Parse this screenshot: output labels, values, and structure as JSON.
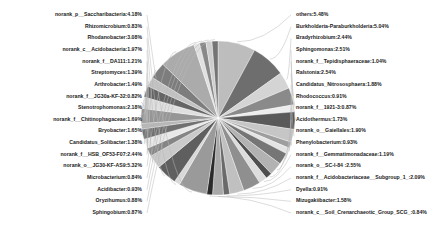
{
  "chart_data": {
    "type": "pie",
    "title": "",
    "subtitle": "",
    "xlabel": "",
    "ylabel": "",
    "legend_position": "labels-with-leader-lines",
    "grid": false,
    "value_unit": "percent",
    "palette": "grayscale",
    "center": {
      "x": 218,
      "y": 118
    },
    "radius": 77,
    "start_angle_deg": -90,
    "direction": "clockwise",
    "categories": [
      "others",
      "Burkholderia-Paraburkholderia",
      "Bradyrhizobium",
      "Sphingomonas",
      "norank_f__Tepidisphaeraceae",
      "Ralstonia",
      "Candidatus_Nitrososphaera",
      "Rhodococcus",
      "norank_f__1921-3",
      "Acidothermus",
      "norank_o__Gaiellales",
      "Phenylobacterium",
      "norank_f__Gemmatimonadaceae",
      "norank_o__SC-I-84",
      "norank_f__Acidobacteriaceae__Subgroup_1_",
      "Dyella",
      "Mizugakiibacter",
      "norank_c__Soil_Crenarchaeotic_Group_SCG_",
      "norank_p__Saccharibacteria",
      "Rhizomicrobium",
      "Rhodanobacter",
      "norank_c__Acidobacteria",
      "norank_f__DA111",
      "Streptomyces",
      "Arthrobacter",
      "norank_f__JG30a-KF-32",
      "Stenotrophomonas",
      "norank_f__Chitinophagaceae",
      "Bryobacter",
      "Candidatus_Solibacter",
      "norank_f__HSB_OF53-F07",
      "norank_o__JG30-KF-AS9",
      "Microbacterium",
      "Acidibacter",
      "Oryzihumus",
      "Sphingobium"
    ],
    "values": [
      5.48,
      5.04,
      2.44,
      2.51,
      1.04,
      2.54,
      1.88,
      0.91,
      0.87,
      1.73,
      1.9,
      0.93,
      1.19,
      2.55,
      2.09,
      0.91,
      1.58,
      0.84,
      4.18,
      0.83,
      3.08,
      1.97,
      1.21,
      1.39,
      1.49,
      0.82,
      2.18,
      1.69,
      1.65,
      1.38,
      2.44,
      5.32,
      0.84,
      0.93,
      0.88,
      0.87
    ],
    "labels": [
      "others:5.48%",
      "Burkholderia-Paraburkholderia:5.04%",
      "Bradyrhizobium:2.44%",
      "Sphingomonas:2.51%",
      "norank_f__Tepidisphaeraceae:1.04%",
      "Ralstonia:2.54%",
      "Candidatus_Nitrososphaera:1.88%",
      "Rhodococcus:0.91%",
      "norank_f__1921-3:0.87%",
      "Acidothermus:1.73%",
      "norank_o__Gaiellales:1.90%",
      "Phenylobacterium:0.93%",
      "norank_f__Gemmatimonadaceae:1.19%",
      "norank_o__SC-I-84 :2.55%",
      "norank_f__Acidobacteriaceae__Subgroup_1_:2.09%",
      "Dyella:0.91%",
      "Mizugakiibacter:1.58%",
      "norank_c__Soil_Crenarchaeotic_Group_SCG_:0.84%",
      "norank_p__Saccharibacteria:4.18%",
      "Rhizomicrobium:0.83%",
      "Rhodanobacter:3.08%",
      "norank_c__Acidobacteria:1.97%",
      "norank_f__DA111:1.21%",
      "Streptomyces:1.39%",
      "Arthrobacter:1.49%",
      "norank_f__JG30a-KF-32:0.82%",
      "Stenotrophomonas:2.18%",
      "norank_f__Chitinophagaceae:1.69%",
      "Bryobacter:1.65%",
      "Candidatus_Solibacter:1.38%",
      "norank_f__HSB_OF53-F07:2.44%",
      "norank_o__JG30-KF-AS9:5.32%",
      "Microbacterium:0.84%",
      "Acidibacter:0.93%",
      "Oryzihumus:0.88%",
      "Sphingobium:0.87%"
    ],
    "colors": [
      "#bdbdbd",
      "#6e6e6e",
      "#d4d4d4",
      "#8a8a8a",
      "#ededed",
      "#5a5a5a",
      "#c6c6c6",
      "#9e9e9e",
      "#e4e4e4",
      "#767676",
      "#b2b2b2",
      "#4e4e4e",
      "#dcdcdc",
      "#8f8f8f",
      "#c0c0c0",
      "#6a6a6a",
      "#a8a8a8",
      "#2a2a2a",
      "#9a9a9a",
      "#d8d8d8",
      "#5f5f5f",
      "#cacaca",
      "#858585",
      "#e8e8e8",
      "#707070",
      "#b6b6b6",
      "#969696",
      "#dfdfdf",
      "#656565",
      "#c2c2c2",
      "#7d7d7d",
      "#ababab",
      "#e0e0e0",
      "#888888",
      "#cecece",
      "#747474"
    ],
    "label_sides": [
      "right",
      "right",
      "right",
      "right",
      "right",
      "right",
      "right",
      "right",
      "right",
      "right",
      "right",
      "right",
      "right",
      "right",
      "right",
      "right",
      "right",
      "right",
      "left",
      "left",
      "left",
      "left",
      "left",
      "left",
      "left",
      "left",
      "left",
      "left",
      "left",
      "left",
      "left",
      "left",
      "left",
      "left",
      "left",
      "left"
    ]
  }
}
